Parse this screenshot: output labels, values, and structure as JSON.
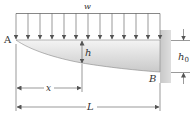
{
  "figure": {
    "load_label": "w",
    "point_labels": {
      "free_end": "A",
      "fixed_end": "B"
    },
    "dimension_labels": {
      "depth_at_x": "h",
      "depth_at_support": "h",
      "depth_at_support_subscript": "0",
      "distance": "x",
      "length": "L"
    },
    "load_arrow_count": 13,
    "colors": {
      "line": "#555555",
      "text": "#333333",
      "beam_light": "#f2f2f2",
      "beam_dark": "#c8c8c8",
      "wall": "#d4d4d4"
    }
  }
}
